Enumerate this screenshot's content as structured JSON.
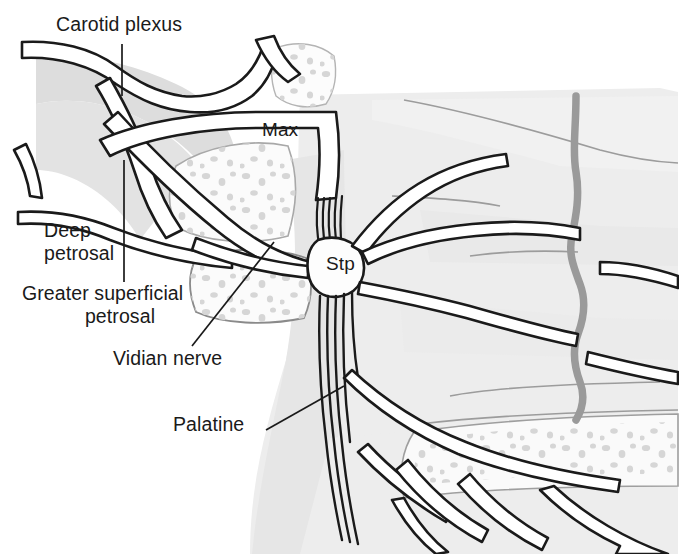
{
  "figure": {
    "background_color": "#ffffff",
    "ink_color": "#1a1a1a",
    "bone_fill": "#f2f2f2",
    "soft_tissue_fill": "#e8e8e8",
    "artery_color": "#9a9a9a",
    "stipple_color": "#d5d5d5"
  },
  "labels": {
    "carotid_plexus": "Carotid plexus",
    "deep_petrosal_line1": "Deep",
    "deep_petrosal_line2": "petrosal",
    "greater_superficial_line1": "Greater superficial",
    "greater_superficial_line2": "petrosal",
    "vidian_nerve": "Vidian nerve",
    "palatine": "Palatine",
    "max": "Max",
    "stp": "Stp"
  },
  "structures": [
    {
      "name": "internal-carotid-artery",
      "label": "Carotid plexus"
    },
    {
      "name": "deep-petrosal-nerve",
      "label": "Deep petrosal"
    },
    {
      "name": "greater-superficial-petrosal-nerve",
      "label": "Greater superficial petrosal"
    },
    {
      "name": "vidian-nerve",
      "label": "Vidian nerve"
    },
    {
      "name": "palatine-nerve",
      "label": "Palatine"
    },
    {
      "name": "maxillary-nerve",
      "label": "Max"
    },
    {
      "name": "sphenopalatine-ganglion",
      "label": "Stp"
    }
  ]
}
